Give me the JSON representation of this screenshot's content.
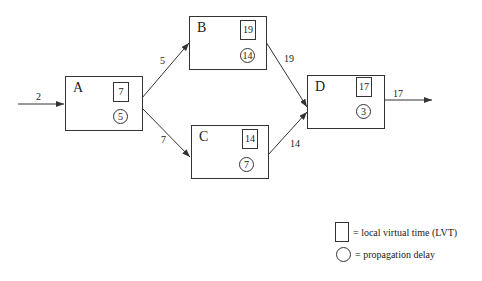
{
  "nodes": {
    "A": {
      "label": "A",
      "lvt": "7",
      "delay": "5"
    },
    "B": {
      "label": "B",
      "lvt": "19",
      "delay": "14"
    },
    "C": {
      "label": "C",
      "lvt": "14",
      "delay": "7"
    },
    "D": {
      "label": "D",
      "lvt": "17",
      "delay": "3"
    }
  },
  "edges": {
    "in_A": "2",
    "A_B": "5",
    "A_C": "7",
    "B_D": "19",
    "C_D": "14",
    "D_out": "17"
  },
  "legend": {
    "square": "= local virtual time (LVT)",
    "circle": "= propagation delay"
  }
}
